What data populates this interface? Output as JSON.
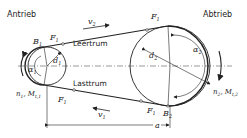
{
  "diagram": {
    "type": "belt-drive",
    "labels": {
      "drive": "Antrieb",
      "driven": "Abtrieb",
      "slack_side": "Leertrum",
      "tight_side": "Lasttrum",
      "center_distance": "a"
    },
    "symbols": {
      "B1": "B",
      "B1_sub": "1",
      "B2": "B",
      "B2_sub": "2",
      "F1_top_left": "F",
      "F1_top_left_sub": "1",
      "F1_top_right": "F",
      "F1_top_right_sub": "1",
      "F1_bottom_left": "F",
      "F1_bottom_left_sub": "1",
      "F1_bottom_right": "F",
      "F1_bottom_right_sub": "1",
      "v2": "v",
      "v2_sub": "2",
      "v1": "v",
      "v1_sub": "1",
      "d1": "d",
      "d1_sub": "1",
      "d2": "d",
      "d2_sub": "2",
      "alpha1": "α",
      "alpha1_sub": "1",
      "alpha2": "α",
      "alpha2_sub": "2",
      "n1M1": "n",
      "n1M1_sub": "1",
      "n1M1_rest": ", M",
      "n1M1_rest_sub": "t,1",
      "n2M2": "n",
      "n2M2_sub": "2",
      "n2M2_rest": ", M",
      "n2M2_rest_sub": "t,2"
    },
    "colors": {
      "line": "#222222",
      "centerline": "#555555",
      "background": "#ffffff"
    }
  }
}
